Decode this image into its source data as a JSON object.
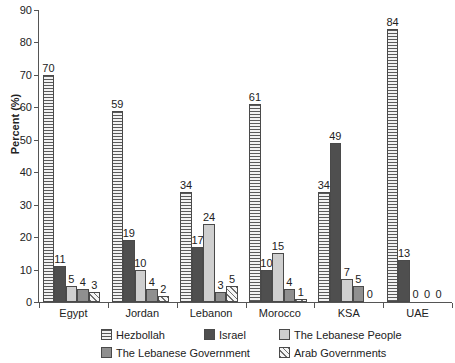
{
  "chart_data": {
    "type": "bar",
    "title": "",
    "subtitle": "",
    "xlabel": "",
    "ylabel": "Percent (%)",
    "ylim": [
      0,
      90
    ],
    "yticks": [
      0,
      10,
      20,
      30,
      40,
      50,
      60,
      70,
      80,
      90
    ],
    "grid": false,
    "legend_position": "bottom",
    "categories": [
      "Egypt",
      "Jordan",
      "Lebanon",
      "Morocco",
      "KSA",
      "UAE"
    ],
    "series": [
      {
        "name": "Hezbollah",
        "pattern": "horizontal-lines",
        "color": "#ededed",
        "values": [
          70,
          59,
          34,
          61,
          34,
          84
        ]
      },
      {
        "name": "Israel",
        "pattern": "solid-dark-gray",
        "color": "#4f4f4f",
        "values": [
          11,
          19,
          17,
          10,
          49,
          13
        ]
      },
      {
        "name": "The Lebanese People",
        "pattern": "solid-light-gray",
        "color": "#cfcfcf",
        "values": [
          5,
          10,
          24,
          15,
          7,
          0
        ]
      },
      {
        "name": "The Lebanese Government",
        "pattern": "solid-medium-gray",
        "color": "#8f8f8f",
        "values": [
          4,
          4,
          3,
          4,
          5,
          0
        ]
      },
      {
        "name": "Arab Governments",
        "pattern": "diagonal-hatch",
        "color": "#f0f0f0",
        "values": [
          3,
          2,
          5,
          1,
          0,
          0
        ]
      }
    ]
  }
}
